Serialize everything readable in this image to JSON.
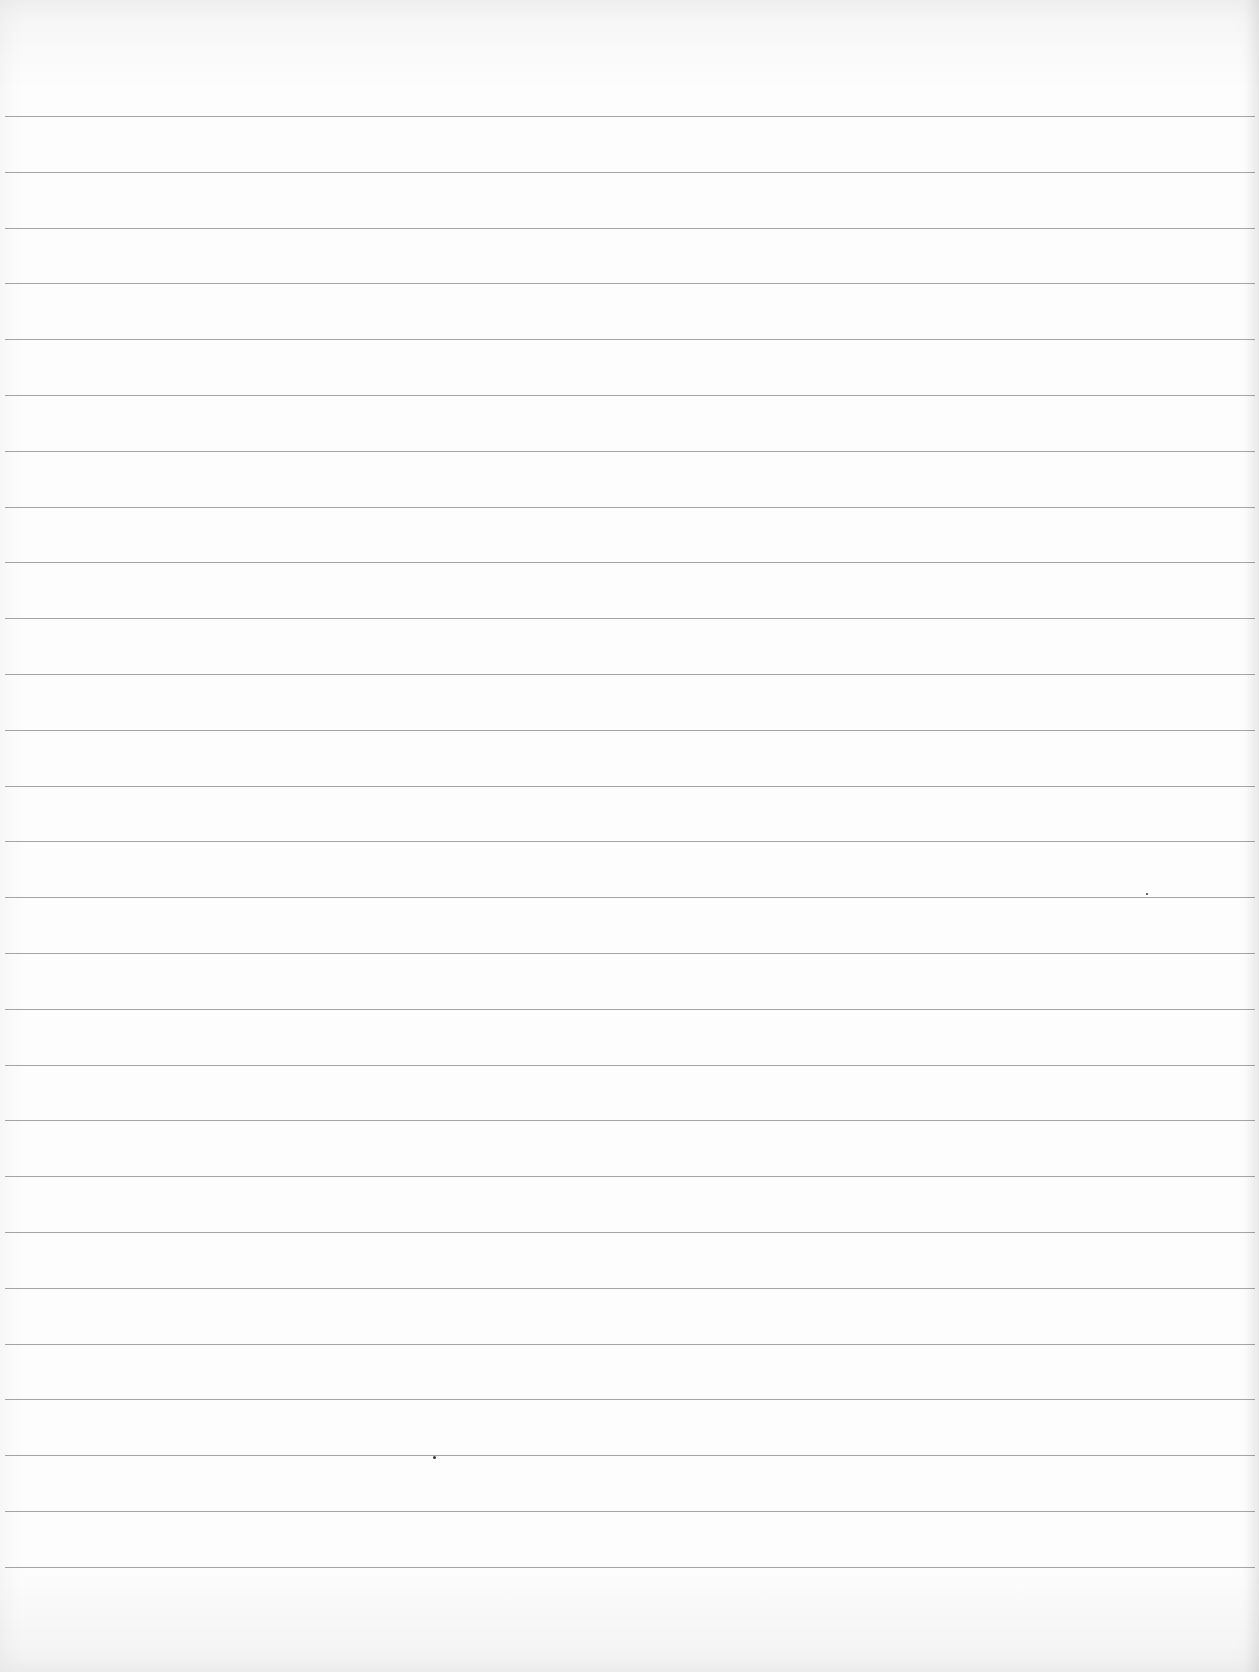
{
  "page": {
    "type": "ruled-paper",
    "paper_color": "#fdfdfd",
    "rule_color": "#9a9a9a",
    "rule_count": 27,
    "first_rule_y": 116,
    "rule_spacing": 55.8,
    "rule_left": 5,
    "rule_right_margin": 4
  },
  "marks": [
    {
      "kind": "speck",
      "x": 433,
      "y": 1456,
      "size": 3
    },
    {
      "kind": "speck",
      "x": 1146,
      "y": 893,
      "size": 2
    }
  ]
}
